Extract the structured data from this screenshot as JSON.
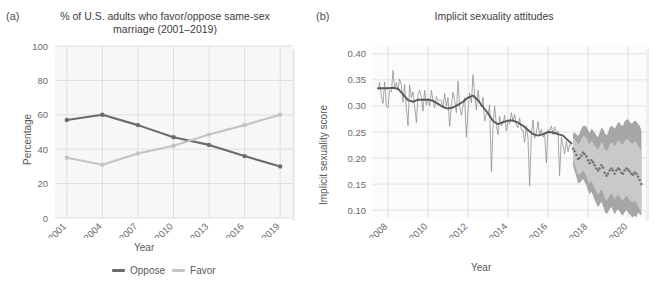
{
  "figure": {
    "background": "#ffffff",
    "panels": [
      {
        "tag": "(a)",
        "title_line1": "% of U.S. adults who favor/oppose same-sex",
        "title_line2": "marriage (2001–2019)"
      },
      {
        "tag": "(b)",
        "title_line1": "Implicit sexuality attitudes",
        "title_line2": ""
      }
    ]
  },
  "panel_a": {
    "tag": "(a)",
    "xlabel": "Year",
    "ylabel": "Percentage",
    "legend": [
      {
        "label": "Oppose",
        "color": "#6b6b6b"
      },
      {
        "label": "Favor",
        "color": "#c4c4c4"
      }
    ],
    "panel_fill": "#f7f7f7",
    "grid_color": "#d9d9d9"
  },
  "panel_b": {
    "tag": "(b)",
    "xlabel": "Year",
    "ylabel": "Implicit sexuality score",
    "panel_fill": "#fbfbfb",
    "grid_color": "#dcdcdc",
    "series_color": "#8c8c8c",
    "trend_color": "#595959",
    "forecast_point_color": "#737373",
    "interval_80_color": "#c9c9c9",
    "interval_95_color": "#a6a6a6"
  },
  "chart_data": [
    {
      "type": "line",
      "panel": "a",
      "title": "% of U.S. adults who favor/oppose same-sex marriage (2001–2019)",
      "xlabel": "Year",
      "ylabel": "Percentage",
      "categories": [
        "2001",
        "2004",
        "2007",
        "2010",
        "2013",
        "2016",
        "2019"
      ],
      "x": [
        2001,
        2004,
        2007,
        2010,
        2013,
        2016,
        2019
      ],
      "xlim": [
        2000,
        2020
      ],
      "ylim": [
        0,
        100
      ],
      "yticks": [
        0,
        20,
        40,
        60,
        80,
        100
      ],
      "grid": true,
      "legend_position": "bottom",
      "series": [
        {
          "name": "Oppose",
          "color": "#6b6b6b",
          "values": [
            57,
            60,
            54,
            47,
            42.5,
            36,
            30
          ]
        },
        {
          "name": "Favor",
          "color": "#c4c4c4",
          "values": [
            35,
            31,
            37.5,
            42,
            48.5,
            54,
            60
          ]
        }
      ]
    },
    {
      "type": "line",
      "panel": "b",
      "title": "Implicit sexuality attitudes",
      "xlabel": "Year",
      "ylabel": "Implicit sexuality score",
      "xlim": [
        2007.2,
        2020.9
      ],
      "ylim": [
        0.085,
        0.415
      ],
      "yticks": [
        0.1,
        0.15,
        0.2,
        0.25,
        0.3,
        0.35,
        0.4
      ],
      "ytick_labels": [
        "0.10",
        "0.15",
        "0.20",
        "0.25",
        "0.30",
        "0.35",
        "0.40"
      ],
      "xticks": [
        2008,
        2010,
        2012,
        2014,
        2016,
        2018,
        2020
      ],
      "xtick_labels": [
        "2008",
        "2010",
        "2012",
        "2014",
        "2016",
        "2018",
        "2020"
      ],
      "grid": true,
      "legend_position": "none",
      "forecast_start": 2017.2,
      "series": [
        {
          "name": "Observed monthly implicit sexuality score",
          "color": "#8c8c8c",
          "x": [
            2007.5,
            2007.58,
            2007.67,
            2007.75,
            2007.83,
            2007.92,
            2008.0,
            2008.08,
            2008.17,
            2008.25,
            2008.33,
            2008.42,
            2008.5,
            2008.58,
            2008.67,
            2008.75,
            2008.83,
            2008.92,
            2009.0,
            2009.08,
            2009.17,
            2009.25,
            2009.33,
            2009.42,
            2009.5,
            2009.58,
            2009.67,
            2009.75,
            2009.83,
            2009.92,
            2010.0,
            2010.08,
            2010.17,
            2010.25,
            2010.33,
            2010.42,
            2010.5,
            2010.58,
            2010.67,
            2010.75,
            2010.83,
            2010.92,
            2011.0,
            2011.08,
            2011.17,
            2011.25,
            2011.33,
            2011.42,
            2011.5,
            2011.58,
            2011.67,
            2011.75,
            2011.83,
            2011.92,
            2012.0,
            2012.08,
            2012.17,
            2012.25,
            2012.33,
            2012.42,
            2012.5,
            2012.58,
            2012.67,
            2012.75,
            2012.83,
            2012.92,
            2013.0,
            2013.08,
            2013.17,
            2013.25,
            2013.33,
            2013.42,
            2013.5,
            2013.58,
            2013.67,
            2013.75,
            2013.83,
            2013.92,
            2014.0,
            2014.08,
            2014.17,
            2014.25,
            2014.33,
            2014.42,
            2014.5,
            2014.58,
            2014.67,
            2014.75,
            2014.83,
            2014.92,
            2015.0,
            2015.08,
            2015.17,
            2015.25,
            2015.33,
            2015.42,
            2015.5,
            2015.58,
            2015.67,
            2015.75,
            2015.83,
            2015.92,
            2016.0,
            2016.08,
            2016.17,
            2016.25,
            2016.33,
            2016.42,
            2016.5,
            2016.58,
            2016.67,
            2016.75,
            2016.83,
            2016.92,
            2017.0,
            2017.08,
            2017.17
          ],
          "values": [
            0.33,
            0.345,
            0.318,
            0.305,
            0.346,
            0.3,
            0.296,
            0.33,
            0.327,
            0.368,
            0.334,
            0.345,
            0.33,
            0.352,
            0.34,
            0.307,
            0.341,
            0.294,
            0.262,
            0.34,
            0.316,
            0.327,
            0.3,
            0.268,
            0.322,
            0.33,
            0.316,
            0.29,
            0.33,
            0.302,
            0.315,
            0.3,
            0.33,
            0.31,
            0.296,
            0.318,
            0.309,
            0.312,
            0.31,
            0.296,
            0.324,
            0.3,
            0.316,
            0.261,
            0.3,
            0.326,
            0.311,
            0.287,
            0.348,
            0.3,
            0.282,
            0.299,
            0.316,
            0.24,
            0.29,
            0.325,
            0.306,
            0.36,
            0.322,
            0.292,
            0.33,
            0.306,
            0.298,
            0.317,
            0.271,
            0.285,
            0.284,
            0.302,
            0.174,
            0.258,
            0.3,
            0.262,
            0.245,
            0.28,
            0.262,
            0.266,
            0.282,
            0.252,
            0.272,
            0.266,
            0.287,
            0.27,
            0.284,
            0.263,
            0.258,
            0.277,
            0.254,
            0.254,
            0.23,
            0.262,
            0.238,
            0.147,
            0.246,
            0.273,
            0.238,
            0.249,
            0.27,
            0.244,
            0.255,
            0.24,
            0.246,
            0.191,
            0.255,
            0.252,
            0.262,
            0.245,
            0.26,
            0.247,
            0.252,
            0.166,
            0.24,
            0.225,
            0.208,
            0.232,
            0.212,
            0.226,
            0.222
          ]
        },
        {
          "name": "Smoothed trend",
          "color": "#595959",
          "x": [
            2007.5,
            2007.75,
            2008.0,
            2008.25,
            2008.5,
            2008.75,
            2009.0,
            2009.25,
            2009.5,
            2009.75,
            2010.0,
            2010.25,
            2010.5,
            2010.75,
            2011.0,
            2011.25,
            2011.5,
            2011.75,
            2012.0,
            2012.25,
            2012.5,
            2012.75,
            2013.0,
            2013.25,
            2013.5,
            2013.75,
            2014.0,
            2014.25,
            2014.5,
            2014.75,
            2015.0,
            2015.25,
            2015.5,
            2015.75,
            2016.0,
            2016.25,
            2016.5,
            2016.75,
            2017.0,
            2017.17
          ],
          "values": [
            0.334,
            0.334,
            0.334,
            0.335,
            0.333,
            0.322,
            0.311,
            0.308,
            0.312,
            0.312,
            0.312,
            0.31,
            0.304,
            0.298,
            0.295,
            0.297,
            0.302,
            0.308,
            0.316,
            0.32,
            0.311,
            0.298,
            0.286,
            0.271,
            0.265,
            0.269,
            0.272,
            0.272,
            0.268,
            0.262,
            0.254,
            0.246,
            0.243,
            0.246,
            0.25,
            0.249,
            0.246,
            0.243,
            0.234,
            0.228
          ]
        }
      ],
      "forecast": {
        "name": "Forecast (point estimates with 80% and 95% prediction intervals)",
        "x": [
          2017.25,
          2017.33,
          2017.42,
          2017.5,
          2017.58,
          2017.67,
          2017.75,
          2017.83,
          2017.92,
          2018.0,
          2018.08,
          2018.17,
          2018.25,
          2018.33,
          2018.42,
          2018.5,
          2018.58,
          2018.67,
          2018.75,
          2018.83,
          2018.92,
          2019.0,
          2019.08,
          2019.17,
          2019.25,
          2019.33,
          2019.42,
          2019.5,
          2019.58,
          2019.67,
          2019.75,
          2019.83,
          2019.92,
          2020.0,
          2020.08,
          2020.17,
          2020.25,
          2020.33,
          2020.42,
          2020.5,
          2020.58,
          2020.67
        ],
        "point": [
          0.218,
          0.213,
          0.206,
          0.198,
          0.2,
          0.205,
          0.21,
          0.208,
          0.203,
          0.196,
          0.19,
          0.196,
          0.192,
          0.186,
          0.18,
          0.176,
          0.18,
          0.186,
          0.182,
          0.172,
          0.166,
          0.17,
          0.176,
          0.18,
          0.176,
          0.17,
          0.176,
          0.18,
          0.178,
          0.172,
          0.17,
          0.176,
          0.18,
          0.178,
          0.174,
          0.17,
          0.168,
          0.172,
          0.17,
          0.164,
          0.158,
          0.15
        ],
        "lower_80": [
          0.196,
          0.188,
          0.178,
          0.168,
          0.168,
          0.172,
          0.176,
          0.172,
          0.166,
          0.158,
          0.15,
          0.156,
          0.15,
          0.142,
          0.136,
          0.13,
          0.134,
          0.14,
          0.134,
          0.124,
          0.118,
          0.122,
          0.128,
          0.132,
          0.128,
          0.12,
          0.126,
          0.13,
          0.126,
          0.12,
          0.118,
          0.124,
          0.128,
          0.124,
          0.12,
          0.116,
          0.114,
          0.118,
          0.114,
          0.108,
          0.102,
          0.094
        ],
        "upper_80": [
          0.238,
          0.236,
          0.232,
          0.226,
          0.23,
          0.236,
          0.242,
          0.242,
          0.238,
          0.232,
          0.226,
          0.234,
          0.23,
          0.224,
          0.22,
          0.216,
          0.222,
          0.23,
          0.228,
          0.218,
          0.214,
          0.218,
          0.226,
          0.23,
          0.228,
          0.222,
          0.228,
          0.234,
          0.232,
          0.226,
          0.226,
          0.232,
          0.236,
          0.236,
          0.232,
          0.228,
          0.228,
          0.232,
          0.23,
          0.224,
          0.22,
          0.212
        ],
        "lower_95": [
          0.186,
          0.176,
          0.164,
          0.152,
          0.152,
          0.156,
          0.16,
          0.154,
          0.148,
          0.138,
          0.13,
          0.136,
          0.128,
          0.12,
          0.112,
          0.106,
          0.11,
          0.116,
          0.108,
          0.098,
          0.092,
          0.096,
          0.102,
          0.106,
          0.1,
          0.092,
          0.098,
          0.102,
          0.098,
          0.092,
          0.09,
          0.096,
          0.1,
          0.096,
          0.092,
          0.088,
          0.086,
          0.09,
          0.086,
          0.096,
          0.092,
          0.09
        ],
        "upper_95": [
          0.248,
          0.248,
          0.246,
          0.242,
          0.248,
          0.256,
          0.262,
          0.262,
          0.26,
          0.254,
          0.248,
          0.256,
          0.254,
          0.248,
          0.244,
          0.24,
          0.248,
          0.258,
          0.256,
          0.248,
          0.244,
          0.248,
          0.258,
          0.262,
          0.26,
          0.256,
          0.262,
          0.268,
          0.268,
          0.262,
          0.262,
          0.27,
          0.274,
          0.274,
          0.27,
          0.266,
          0.268,
          0.272,
          0.27,
          0.266,
          0.262,
          0.254
        ]
      }
    }
  ]
}
